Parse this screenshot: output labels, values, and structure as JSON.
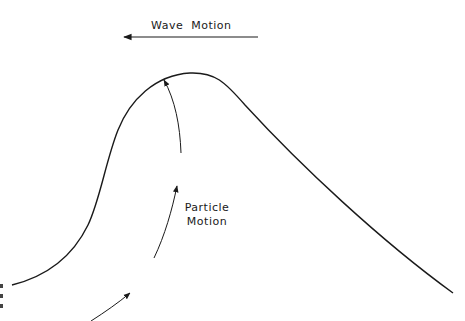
{
  "diagram": {
    "labels": {
      "wave_motion": "Wave Motion",
      "particle_line1": "Particle",
      "particle_line2": "Motion"
    },
    "colors": {
      "stroke": "#1a1a1a",
      "background": "#ffffff"
    },
    "elements": [
      {
        "type": "arrow",
        "name": "wave-motion-arrow",
        "direction": "left",
        "from": [
          258,
          37
        ],
        "to": [
          123,
          37
        ]
      },
      {
        "type": "curve",
        "name": "wave-profile",
        "description": "asymmetric wave crest, steep front on left, gentle back slope on right",
        "peak": [
          197,
          73
        ]
      },
      {
        "type": "arrow",
        "name": "particle-arrow-upper",
        "direction": "up-left"
      },
      {
        "type": "arrow",
        "name": "particle-arrow-middle",
        "direction": "up-right"
      },
      {
        "type": "arrow",
        "name": "particle-arrow-lower",
        "direction": "up-right"
      }
    ]
  }
}
